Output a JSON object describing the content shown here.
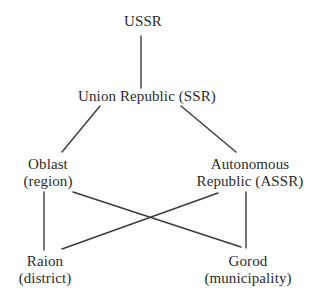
{
  "diagram": {
    "background_color": "#ffffff",
    "text_color": "#2b2b2b",
    "edge_color": "#3a3a3a",
    "nodes": [
      {
        "id": "ussr",
        "line1": "USSR",
        "line2": ""
      },
      {
        "id": "ssr",
        "line1": "Union Republic (SSR)",
        "line2": ""
      },
      {
        "id": "oblast",
        "line1": "Oblast",
        "line2": "(region)"
      },
      {
        "id": "assr",
        "line1": "Autonomous",
        "line2": "Republic (ASSR)"
      },
      {
        "id": "raion",
        "line1": "Raion",
        "line2": "(district)"
      },
      {
        "id": "gorod",
        "line1": "Gorod",
        "line2": "(municipality)"
      }
    ],
    "edges": [
      {
        "from": "ussr",
        "to": "ssr",
        "x1": 141,
        "y1": 36,
        "x2": 141,
        "y2": 88
      },
      {
        "from": "ssr",
        "to": "oblast",
        "x1": 100,
        "y1": 106,
        "x2": 62,
        "y2": 152
      },
      {
        "from": "ssr",
        "to": "assr",
        "x1": 181,
        "y1": 106,
        "x2": 236,
        "y2": 152
      },
      {
        "from": "oblast",
        "to": "raion",
        "x1": 44,
        "y1": 192,
        "x2": 44,
        "y2": 250
      },
      {
        "from": "oblast",
        "to": "gorod",
        "x1": 73,
        "y1": 192,
        "x2": 241,
        "y2": 247
      },
      {
        "from": "assr",
        "to": "raion",
        "x1": 218,
        "y1": 193,
        "x2": 62,
        "y2": 249
      },
      {
        "from": "assr",
        "to": "gorod",
        "x1": 246,
        "y1": 192,
        "x2": 246,
        "y2": 248
      }
    ]
  }
}
